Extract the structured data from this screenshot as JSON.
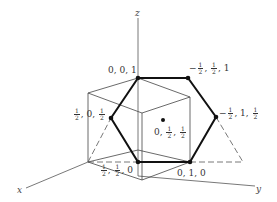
{
  "diagram": {
    "axes": {
      "x": "x",
      "y": "y",
      "z": "z"
    },
    "points": [
      {
        "id": "p001",
        "label": "0, 0, 1"
      },
      {
        "id": "pm_half_half_1",
        "label_parts": {
          "sign": "−",
          "a_num": "1",
          "a_den": "2",
          "b_num": "1",
          "b_den": "2",
          "c": "1"
        }
      },
      {
        "id": "p_half_0_half",
        "label_parts": {
          "a_num": "1",
          "a_den": "2",
          "b": "0",
          "c_num": "1",
          "c_den": "2"
        }
      },
      {
        "id": "p0_half_half",
        "label_parts": {
          "a": "0",
          "b_num": "1",
          "b_den": "2",
          "c_num": "1",
          "c_den": "2"
        }
      },
      {
        "id": "pm_half_1_half",
        "label_parts": {
          "sign": "−",
          "a_num": "1",
          "a_den": "2",
          "b": "1",
          "c_num": "1",
          "c_den": "2"
        }
      },
      {
        "id": "p_half_half_0",
        "label_parts": {
          "a_num": "1",
          "a_den": "2",
          "b_num": "1",
          "b_den": "2",
          "c": "0"
        }
      },
      {
        "id": "p010",
        "label": "0, 1, 0"
      }
    ],
    "sep": ", "
  }
}
